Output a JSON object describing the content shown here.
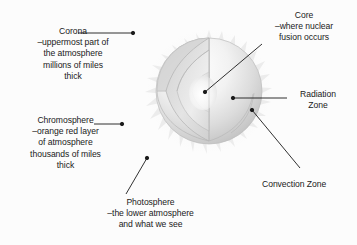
{
  "diagram": {
    "background_color": "#fcfcfc",
    "ink_color": "#1a1a1a",
    "sun": {
      "name": "sun",
      "center_x": 209,
      "center_y": 91,
      "radius": 53,
      "body_fill_light": "#fbfbfb",
      "body_fill_mid": "#e3e3e3",
      "body_fill_dark": "#c9c9c9",
      "corona_spike_color": "#ebebeb",
      "corona_spike_count": 30
    },
    "cutaway": {
      "name": "cutaway-wedge",
      "convection_fill": "#dedede",
      "radiation_fill": "#e8e8e8",
      "core_fill": "#f7f7f7",
      "edge_stroke": "#b4b4b4"
    }
  },
  "labels": {
    "corona": {
      "name": "corona",
      "lines": [
        "Corona",
        "–uppermost part of",
        "the atmosphere",
        "millions of miles",
        "thick"
      ],
      "text": "Corona\n–uppermost part of\nthe atmosphere\nmillions of miles\nthick",
      "leader": {
        "from_x": 78,
        "from_y": 33,
        "to_x": 133,
        "to_y": 33,
        "dot_x": 133,
        "dot_y": 33
      }
    },
    "chromosphere": {
      "name": "chromosphere",
      "lines": [
        "Chromosphere",
        "–orange red layer",
        "of atmosphere",
        "thousands of miles",
        "thick"
      ],
      "text": "Chromosphere\n–orange red layer\nof atmosphere\nthousands of miles\nthick",
      "leader": {
        "from_x": 94,
        "from_y": 124,
        "to_x": 122,
        "to_y": 124,
        "dot_x": 122,
        "dot_y": 124
      }
    },
    "photosphere": {
      "name": "photosphere",
      "lines": [
        "Photosphere",
        "–the lower atmosphere",
        "and what we see"
      ],
      "text": "Photosphere\n–the lower atmosphere\nand what we see",
      "leader": {
        "from_x": 126,
        "from_y": 194,
        "to_x": 147,
        "to_y": 158,
        "dot_x": 147,
        "dot_y": 158
      }
    },
    "core": {
      "name": "core",
      "lines": [
        "Core",
        "–where nuclear",
        "fusion occurs"
      ],
      "text": "Core\n–where nuclear\nfusion occurs",
      "leader": {
        "from_x": 262,
        "from_y": 44,
        "to_x": 205,
        "to_y": 92,
        "dot_x": 205,
        "dot_y": 92
      }
    },
    "radiation_zone": {
      "name": "radiation-zone",
      "lines": [
        "Radiation",
        "Zone"
      ],
      "text": "Radiation\nZone",
      "leader": {
        "from_x": 287,
        "from_y": 98,
        "to_x": 233,
        "to_y": 98,
        "dot_x": 233,
        "dot_y": 98
      }
    },
    "convection_zone": {
      "name": "convection-zone",
      "lines": [
        "Convection Zone"
      ],
      "text": "Convection Zone",
      "leader": {
        "from_x": 300,
        "from_y": 168,
        "to_x": 252,
        "to_y": 110,
        "dot_x": 252,
        "dot_y": 110
      }
    }
  }
}
